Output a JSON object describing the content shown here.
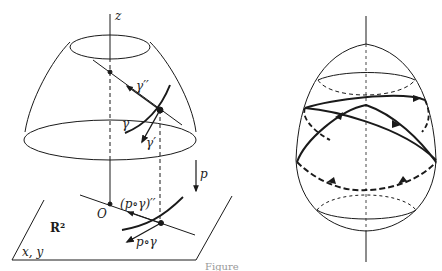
{
  "figure": {
    "left_panel": {
      "name": "projection-of-surface-curve",
      "labels": {
        "z_axis": "z",
        "gamma_second_derivative": "γ′′",
        "gamma": "γ",
        "gamma_prime": "γ′",
        "projection_map": "p",
        "composite_second_derivative": "(p∘γ)′′",
        "origin": "O",
        "plane": "R²",
        "composite_curve": "p∘γ",
        "plane_coords": "x, y"
      }
    },
    "right_panel": {
      "name": "closed-geodesic-on-ovaloid"
    },
    "caption": "Figure"
  },
  "colors": {
    "ink": "#1a1a1a",
    "background": "#ffffff"
  }
}
